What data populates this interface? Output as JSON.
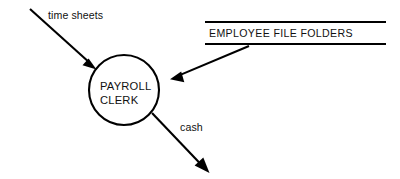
{
  "diagram": {
    "type": "data-flow-diagram",
    "background_color": "#ffffff",
    "line_color": "#000000",
    "process": {
      "shape": "circle",
      "label_line1": "PAYROLL",
      "label_line2": "CLERK",
      "center_x": 124,
      "center_y": 90,
      "radius": 35
    },
    "data_store": {
      "label": "EMPLOYEE FILE FOLDERS",
      "style": "open-ended-rectangle",
      "x1": 205,
      "x2": 386,
      "top_y": 22,
      "bottom_y": 44
    },
    "flows": [
      {
        "id": "flow-time-sheets",
        "label": "time sheets",
        "from": "external",
        "to": "payroll-clerk",
        "start_x": 30,
        "start_y": 9,
        "end_x": 96,
        "end_y": 69,
        "label_x": 48,
        "label_y": 19
      },
      {
        "id": "flow-employee-records",
        "label": "",
        "from": "employee-file-folders",
        "to": "payroll-clerk",
        "start_x": 249,
        "start_y": 46,
        "end_x": 170,
        "end_y": 79,
        "label_x": 0,
        "label_y": 0
      },
      {
        "id": "flow-cash",
        "label": "cash",
        "from": "payroll-clerk",
        "to": "external",
        "start_x": 152,
        "start_y": 113,
        "end_x": 209,
        "end_y": 173,
        "label_x": 180,
        "label_y": 131
      }
    ]
  }
}
